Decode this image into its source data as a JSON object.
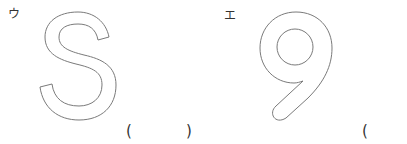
{
  "items": [
    {
      "label": "ウ",
      "glyph": "S",
      "answer_open": "(",
      "answer_close": ")"
    },
    {
      "label": "エ",
      "glyph": "9",
      "answer_open": "("
    }
  ],
  "colors": {
    "outline": "#7a7a7a",
    "text": "#333333",
    "background": "#ffffff"
  }
}
